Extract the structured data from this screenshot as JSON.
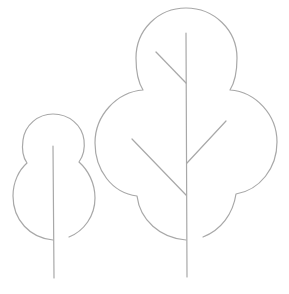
{
  "illustration": {
    "subject": "two-trees-line-icon",
    "stroke_color": "#a8a8a8",
    "background": "#ffffff",
    "trees": [
      {
        "name": "small-tree",
        "description": "small two-lobed tree with a single trunk"
      },
      {
        "name": "large-tree",
        "description": "large four-lobed tree with trunk and three branches"
      }
    ]
  }
}
